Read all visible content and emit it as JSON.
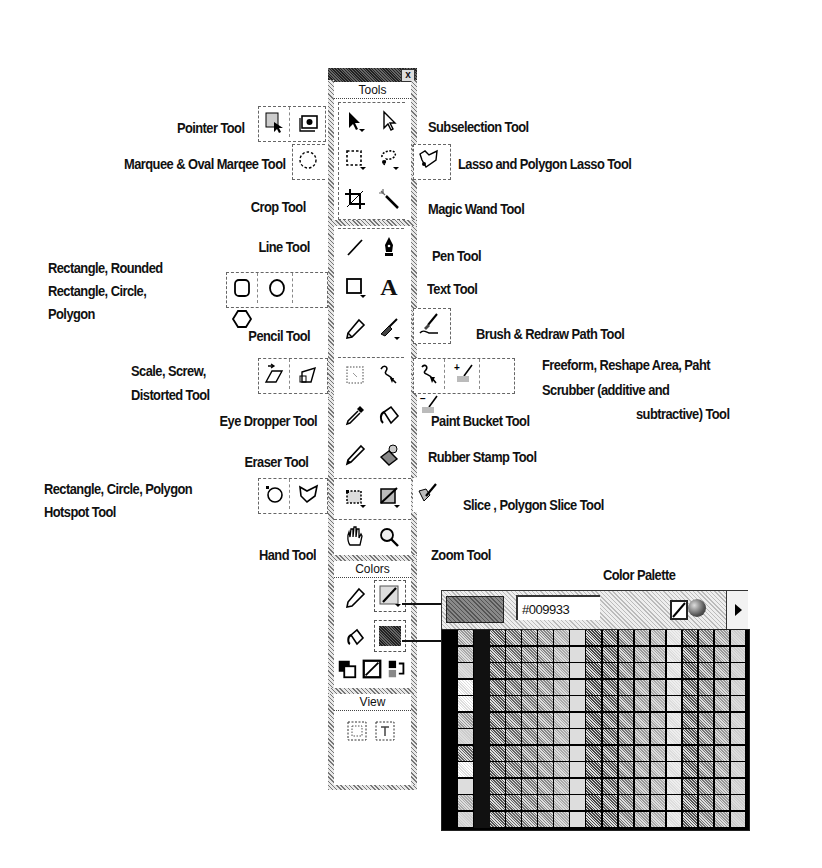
{
  "toolbox": {
    "close_glyph": "x",
    "sections": {
      "tools": "Tools",
      "colors": "Colors",
      "view": "View"
    },
    "tools_grid": [
      [
        "pointer-icon",
        "subselection-icon"
      ],
      [
        "marquee-icon",
        "lasso-icon"
      ],
      [
        "crop-icon",
        "magic-wand-icon"
      ],
      [
        "line-icon",
        "pen-icon"
      ],
      [
        "rectangle-icon",
        "text-icon"
      ],
      [
        "pencil-icon",
        "brush-icon"
      ],
      [
        "scale-icon",
        "freeform-icon"
      ],
      [
        "eyedropper-icon",
        "paint-bucket-icon"
      ],
      [
        "eraser-icon",
        "rubber-stamp-icon"
      ],
      [
        "hotspot-icon",
        "slice-icon"
      ],
      [
        "hand-icon",
        "zoom-icon"
      ]
    ],
    "text_tool_glyph": "A"
  },
  "labels": {
    "pointer": "Pointer Tool",
    "subselection": "Subselection Tool",
    "marquee": "Marquee & Oval Marqee  Tool",
    "lasso": "Lasso and Polygon Lasso Tool",
    "crop": "Crop Tool",
    "magic_wand": "Magic Wand Tool",
    "line": "Line Tool",
    "pen": "Pen Tool",
    "shapes": [
      "Rectangle, Rounded",
      "Rectangle, Circle,",
      "Polygon"
    ],
    "text": "Text Tool",
    "pencil": "Pencil Tool",
    "brush": "Brush & Redraw Path Tool",
    "scale": [
      "Scale, Screw,",
      "Distorted Tool"
    ],
    "freeform": [
      "Freeform, Reshape Area, Paht",
      "Scrubber  (additive and",
      "subtractive) Tool"
    ],
    "eyedropper": "Eye Dropper Tool",
    "paint_bucket": "Paint Bucket Tool",
    "eraser": "Eraser Tool",
    "rubber_stamp": "Rubber Stamp Tool",
    "hotspot": [
      "Rectangle, Circle, Polygon",
      "Hotspot Tool"
    ],
    "slice": "Slice , Polygon Slice Tool",
    "hand": "Hand Tool",
    "zoom": "Zoom Tool",
    "color_palette": "Color Palette"
  },
  "palette": {
    "hex_value": "#009933",
    "grid_columns": 19,
    "grid_rows": 12
  },
  "colors": {
    "ink": "#111111",
    "frame_hatch": "#777777",
    "titlebar": "#222222"
  }
}
